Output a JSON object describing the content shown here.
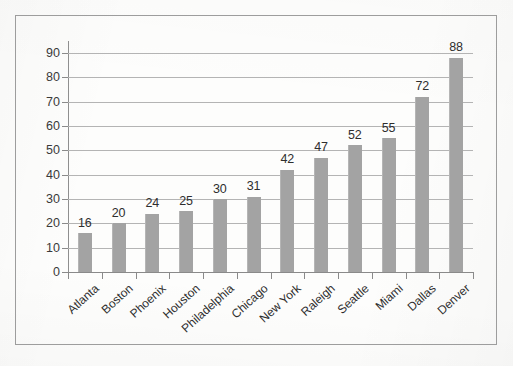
{
  "chart_data": {
    "type": "bar",
    "title": "",
    "subtitle": "",
    "xlabel": "",
    "ylabel": "",
    "ylim": [
      0,
      90
    ],
    "ytick_step": 10,
    "yticks": [
      0,
      10,
      20,
      30,
      40,
      50,
      60,
      70,
      80,
      90
    ],
    "ytick_labels": [
      "0",
      "10",
      "20",
      "30",
      "40",
      "50",
      "60",
      "70",
      "80",
      "90"
    ],
    "grid": "horizontal",
    "legend": "none",
    "data_labels": true,
    "categories": [
      "Atlanta",
      "Boston",
      "Phoenix",
      "Houston",
      "Philadelphia",
      "Chicago",
      "New York",
      "Raleigh",
      "Seattle",
      "Miami",
      "Dallas",
      "Denver"
    ],
    "values": [
      16,
      20,
      24,
      25,
      30,
      31,
      42,
      47,
      52,
      55,
      72,
      88
    ],
    "value_labels": [
      "16",
      "20",
      "24",
      "25",
      "30",
      "31",
      "42",
      "47",
      "52",
      "55",
      "72",
      "88"
    ]
  },
  "colors": {
    "bar_fill": "#a3a3a3",
    "gridline": "#b4b4b4",
    "axis_line": "#8a8a8a",
    "frame_border": "#9d9d9d",
    "tick_label": "#3a3a3a",
    "data_label": "#2e2e2e",
    "page_background": "#fdfdfc"
  }
}
